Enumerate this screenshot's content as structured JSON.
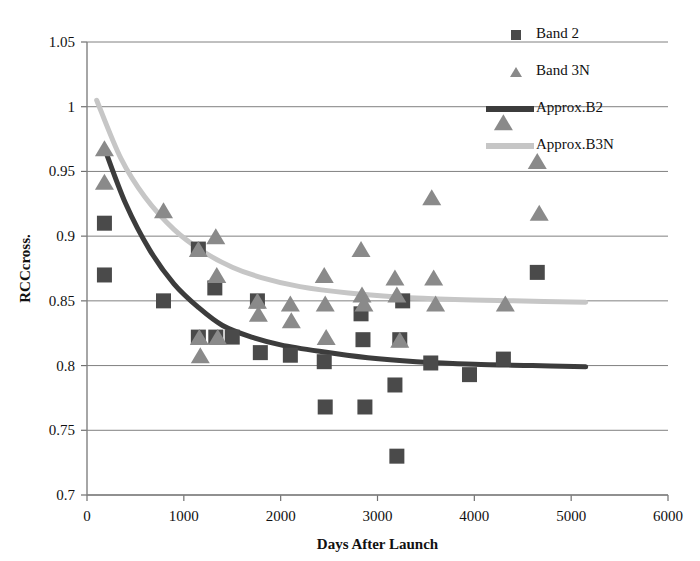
{
  "chart_data": {
    "type": "scatter",
    "title": "",
    "xlabel": "Days After Launch",
    "ylabel": "RCCcross.",
    "xlim": [
      0,
      6000
    ],
    "ylim": [
      0.7,
      1.05
    ],
    "xticks": [
      0,
      1000,
      2000,
      3000,
      4000,
      5000,
      6000
    ],
    "xtick_labels": [
      "0",
      "1000",
      "2000",
      "3000",
      "4000",
      "5000",
      "6000"
    ],
    "yticks": [
      0.7,
      0.75,
      0.8,
      0.85,
      0.9,
      0.95,
      1,
      1.05
    ],
    "ytick_labels": [
      "0.7",
      "0.75",
      "0.8",
      "0.85",
      "0.9",
      "0.95",
      "1",
      "1.05"
    ],
    "grid": "horizontal",
    "legend_position": "top-right",
    "series": [
      {
        "name": "Band 2",
        "marker": "square",
        "color": "#4a4a4a",
        "points": [
          [
            180,
            0.91
          ],
          [
            180,
            0.87
          ],
          [
            790,
            0.85
          ],
          [
            1150,
            0.89
          ],
          [
            1150,
            0.822
          ],
          [
            1320,
            0.86
          ],
          [
            1330,
            0.822
          ],
          [
            1500,
            0.822
          ],
          [
            1760,
            0.85
          ],
          [
            1790,
            0.81
          ],
          [
            2100,
            0.808
          ],
          [
            2450,
            0.803
          ],
          [
            2460,
            0.768
          ],
          [
            2830,
            0.84
          ],
          [
            2850,
            0.82
          ],
          [
            2870,
            0.768
          ],
          [
            3180,
            0.785
          ],
          [
            3200,
            0.73
          ],
          [
            3230,
            0.82
          ],
          [
            3260,
            0.85
          ],
          [
            3550,
            0.802
          ],
          [
            3950,
            0.793
          ],
          [
            4300,
            0.805
          ],
          [
            4650,
            0.872
          ]
        ]
      },
      {
        "name": "Band 3N",
        "marker": "triangle",
        "color": "#8a8a8a",
        "points": [
          [
            180,
            0.968
          ],
          [
            180,
            0.942
          ],
          [
            790,
            0.92
          ],
          [
            1150,
            0.89
          ],
          [
            1160,
            0.822
          ],
          [
            1170,
            0.808
          ],
          [
            1330,
            0.9
          ],
          [
            1340,
            0.87
          ],
          [
            1350,
            0.822
          ],
          [
            1760,
            0.85
          ],
          [
            1770,
            0.84
          ],
          [
            2100,
            0.848
          ],
          [
            2110,
            0.835
          ],
          [
            2450,
            0.87
          ],
          [
            2460,
            0.848
          ],
          [
            2470,
            0.822
          ],
          [
            2830,
            0.89
          ],
          [
            2840,
            0.855
          ],
          [
            2860,
            0.848
          ],
          [
            3180,
            0.868
          ],
          [
            3200,
            0.855
          ],
          [
            3230,
            0.82
          ],
          [
            3560,
            0.93
          ],
          [
            3580,
            0.868
          ],
          [
            3600,
            0.848
          ],
          [
            4300,
            0.988
          ],
          [
            4320,
            0.848
          ],
          [
            4650,
            0.958
          ],
          [
            4670,
            0.918
          ]
        ]
      }
    ],
    "fits": [
      {
        "name": "Approx.B2",
        "color": "#3c3c3c",
        "curve": [
          [
            180,
            0.968
          ],
          [
            400,
            0.925
          ],
          [
            650,
            0.889
          ],
          [
            900,
            0.863
          ],
          [
            1150,
            0.845
          ],
          [
            1400,
            0.831
          ],
          [
            1700,
            0.822
          ],
          [
            2000,
            0.816
          ],
          [
            2400,
            0.811
          ],
          [
            2900,
            0.806
          ],
          [
            3400,
            0.803
          ],
          [
            4000,
            0.801
          ],
          [
            4600,
            0.8
          ],
          [
            5150,
            0.799
          ]
        ]
      },
      {
        "name": "Approx.B3N",
        "color": "#c6c6c6",
        "curve": [
          [
            100,
            1.005
          ],
          [
            350,
            0.96
          ],
          [
            600,
            0.93
          ],
          [
            900,
            0.905
          ],
          [
            1200,
            0.888
          ],
          [
            1500,
            0.876
          ],
          [
            1800,
            0.868
          ],
          [
            2200,
            0.861
          ],
          [
            2700,
            0.856
          ],
          [
            3200,
            0.853
          ],
          [
            3800,
            0.851
          ],
          [
            4400,
            0.85
          ],
          [
            5150,
            0.849
          ]
        ]
      }
    ],
    "legend": [
      {
        "label": "Band 2",
        "kind": "square",
        "color": "#4a4a4a"
      },
      {
        "label": "Band 3N",
        "kind": "triangle",
        "color": "#8a8a8a"
      },
      {
        "label": "Approx.B2",
        "kind": "line",
        "color": "#3c3c3c"
      },
      {
        "label": "Approx.B3N",
        "kind": "line",
        "color": "#c6c6c6"
      }
    ]
  },
  "colors": {
    "band2": "#4a4a4a",
    "band3n": "#8a8a8a",
    "approx_b2": "#3c3c3c",
    "approx_b3n": "#c6c6c6",
    "grid": "#808080",
    "background": "#ffffff"
  }
}
